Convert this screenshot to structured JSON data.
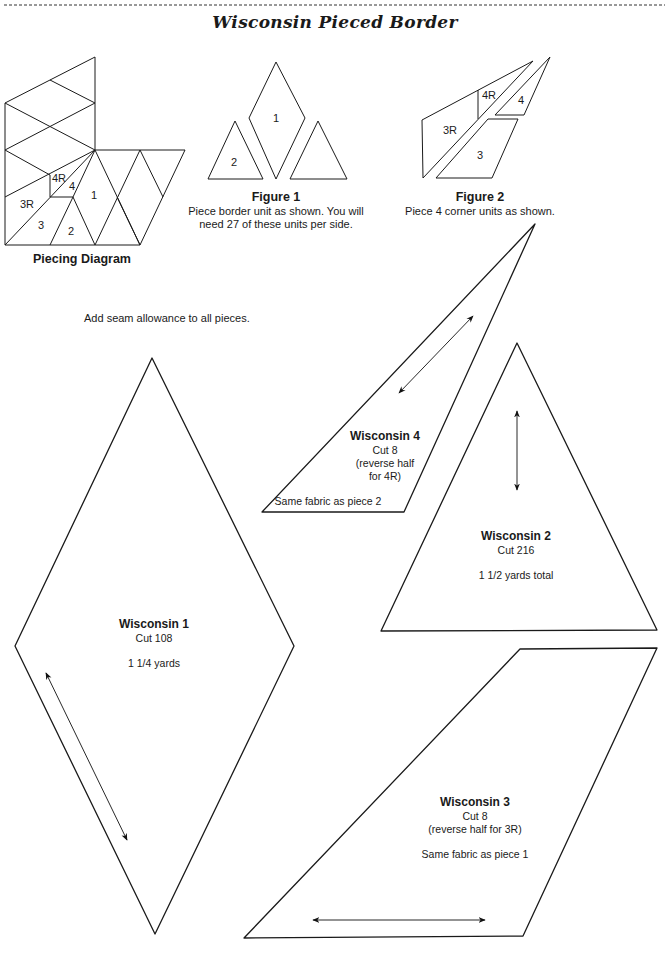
{
  "page": {
    "title": "Wisconsin Pieced Border",
    "note": "Add seam allowance to all pieces."
  },
  "piecing_diagram": {
    "caption": "Piecing Diagram",
    "labels": [
      "4R",
      "4",
      "3R",
      "1",
      "3",
      "2"
    ]
  },
  "figure1": {
    "caption": "Figure 1",
    "text_line1": "Piece border unit as shown. You will",
    "text_line2": "need 27 of these units per side.",
    "labels": [
      "1",
      "2"
    ]
  },
  "figure2": {
    "caption": "Figure 2",
    "text": "Piece 4 corner units as shown.",
    "labels": [
      "4R",
      "4",
      "3R",
      "3"
    ]
  },
  "templates": [
    {
      "name": "Wisconsin 1",
      "cut": "Cut 108",
      "note": "",
      "fabric": "1 1/4 yards"
    },
    {
      "name": "Wisconsin 2",
      "cut": "Cut 216",
      "note": "",
      "fabric": "1 1/2 yards total"
    },
    {
      "name": "Wisconsin 3",
      "cut": "Cut 8",
      "note": "(reverse half for 3R)",
      "fabric": "Same fabric as piece 1"
    },
    {
      "name": "Wisconsin 4",
      "cut": "Cut 8",
      "note_line1": "(reverse half",
      "note_line2": "for 4R)",
      "fabric": "Same fabric as piece 2"
    }
  ]
}
